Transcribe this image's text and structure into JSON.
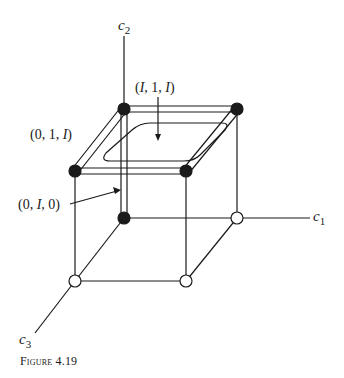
{
  "diagram": {
    "axes": {
      "c1": {
        "name": "c",
        "sub": "1"
      },
      "c2": {
        "name": "c",
        "sub": "2"
      },
      "c3": {
        "name": "c",
        "sub": "3"
      }
    },
    "labels": {
      "top_face": {
        "pre": "(",
        "a": "I",
        "mid": ", 1, ",
        "b": "I",
        "post": ")"
      },
      "left_top_edge": {
        "pre": "(0, 1, ",
        "a": "I",
        "post": ")"
      },
      "back_vertical_edge": {
        "pre": "(0, ",
        "a": "I",
        "post": ", 0)"
      }
    },
    "nodes": [
      {
        "id": "back-top-left",
        "filled": true
      },
      {
        "id": "back-top-right",
        "filled": true
      },
      {
        "id": "front-top-left",
        "filled": true
      },
      {
        "id": "front-top-right",
        "filled": true
      },
      {
        "id": "back-bottom-left",
        "filled": true
      },
      {
        "id": "back-bottom-right",
        "filled": false
      },
      {
        "id": "front-bottom-left",
        "filled": false
      },
      {
        "id": "front-bottom-right",
        "filled": false
      }
    ],
    "colors": {
      "ink": "#1a1a1a",
      "background": "#ffffff"
    }
  },
  "caption": "Figure 4.19"
}
